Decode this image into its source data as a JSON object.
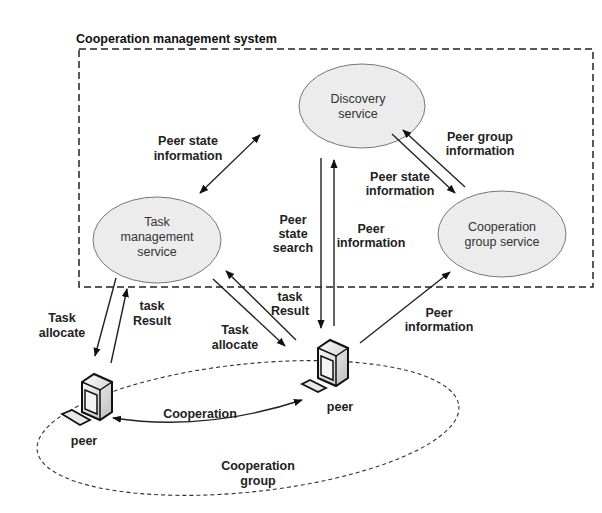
{
  "diagram": {
    "title": "Cooperation management system",
    "nodes": {
      "discovery": {
        "line1": "Discovery",
        "line2": "service"
      },
      "task": {
        "line1": "Task",
        "line2": "management",
        "line3": "service"
      },
      "coop_group": {
        "line1": "Cooperation",
        "line2": "group service"
      }
    },
    "peers": {
      "left": {
        "label": "peer"
      },
      "right": {
        "label": "peer"
      }
    },
    "group": {
      "line1": "Cooperation",
      "line2": "group"
    },
    "edges": {
      "peer_state_info_left": {
        "line1": "Peer state",
        "line2": "information"
      },
      "peer_group_info": {
        "line1": "Peer group",
        "line2": "information"
      },
      "peer_state_info_right": {
        "line1": "Peer state",
        "line2": "information"
      },
      "peer_state_search": {
        "line1": "Peer",
        "line2": "state",
        "line3": "search"
      },
      "peer_info_up": {
        "line1": "Peer",
        "line2": "information"
      },
      "peer_info_coop": {
        "line1": "Peer",
        "line2": "information"
      },
      "task_allocate_left": {
        "line1": "Task",
        "line2": "allocate"
      },
      "task_result_left": {
        "line1": "task",
        "line2": "Result"
      },
      "task_result_right": {
        "line1": "task",
        "line2": "Result"
      },
      "task_allocate_right": {
        "line1": "Task",
        "line2": "allocate"
      },
      "cooperation": {
        "label": "Cooperation"
      }
    }
  }
}
